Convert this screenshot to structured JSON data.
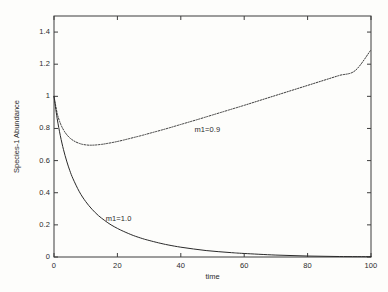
{
  "chart_data": {
    "type": "line",
    "title": "",
    "xlabel": "time",
    "ylabel": "Species-1 Abundance",
    "xlim": [
      0,
      100
    ],
    "ylim": [
      0,
      1.5
    ],
    "grid": false,
    "legend_position": "inline-annotations",
    "xticks": [
      "0",
      "20",
      "40",
      "60",
      "80",
      "100"
    ],
    "xtick_values": [
      0,
      20,
      40,
      60,
      80,
      100
    ],
    "yticks": [
      "0",
      "0.2",
      "0.4",
      "0.6",
      "0.8",
      "1",
      "1.2",
      "1.4"
    ],
    "ytick_values": [
      0,
      0.2,
      0.4,
      0.6,
      0.8,
      1,
      1.2,
      1.4
    ],
    "annotations": [
      {
        "text": "m1=0.9",
        "x": 50,
        "y": 0.79
      },
      {
        "text": "m1=1.0",
        "x": 22,
        "y": 0.235
      }
    ],
    "series": [
      {
        "name": "m1=0.9",
        "style": "dotted",
        "color": "#3a3a3a",
        "x": [
          0,
          1,
          2,
          3,
          4,
          5,
          6,
          7,
          8,
          9,
          10,
          11,
          12,
          13,
          14,
          15,
          16,
          18,
          20,
          22,
          25,
          28,
          30,
          35,
          40,
          45,
          50,
          55,
          60,
          65,
          70,
          75,
          80,
          85,
          90,
          95,
          100
        ],
        "values": [
          1.0,
          0.895,
          0.832,
          0.791,
          0.762,
          0.741,
          0.726,
          0.715,
          0.707,
          0.701,
          0.698,
          0.696,
          0.696,
          0.697,
          0.699,
          0.701,
          0.704,
          0.711,
          0.719,
          0.728,
          0.743,
          0.758,
          0.769,
          0.796,
          0.825,
          0.854,
          0.884,
          0.914,
          0.944,
          0.975,
          1.006,
          1.037,
          1.068,
          1.099,
          1.13,
          1.16,
          1.29
        ]
      },
      {
        "name": "m1=1.0",
        "style": "solid",
        "color": "#2a2a2a",
        "x": [
          0,
          1,
          2,
          3,
          4,
          5,
          6,
          8,
          10,
          12,
          14,
          16,
          18,
          20,
          22,
          25,
          28,
          30,
          33,
          36,
          40,
          44,
          48,
          52,
          56,
          60,
          70,
          80,
          90,
          100
        ],
        "values": [
          1.0,
          0.862,
          0.755,
          0.668,
          0.597,
          0.537,
          0.487,
          0.406,
          0.345,
          0.297,
          0.258,
          0.227,
          0.2,
          0.178,
          0.159,
          0.134,
          0.114,
          0.103,
          0.088,
          0.075,
          0.061,
          0.05,
          0.04,
          0.033,
          0.027,
          0.022,
          0.012,
          0.006,
          0.003,
          0.002
        ]
      }
    ]
  },
  "axes": {
    "frame_color": "#3d3d3d"
  }
}
